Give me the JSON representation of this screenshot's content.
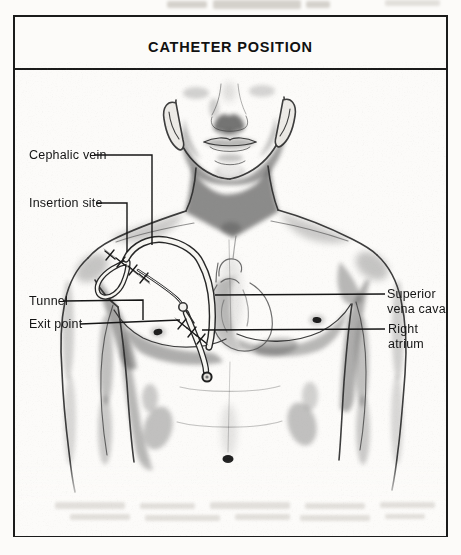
{
  "title": "CATHETER POSITION",
  "labels": {
    "cephalic_vein": "Cephalic vein",
    "insertion_site": "Insertion site",
    "tunnel": "Tunnel",
    "exit_point": "Exit point",
    "superior_vena_cava": "Superior vena cava",
    "right_atrium": "Right atrium"
  },
  "colors": {
    "ink": "#1a1a1a",
    "paper": "#fcfbf9",
    "catheter_outline": "#262626",
    "catheter_fill": "#f7f6f2"
  }
}
